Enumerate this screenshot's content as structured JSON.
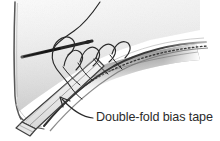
{
  "figure": {
    "kind": "technical-illustration",
    "medium": "pencil-sketch",
    "background_color": "#ffffff",
    "width": 220,
    "height": 141
  },
  "annotations": {
    "callouts": [
      {
        "id": "bias-tape",
        "label": "Double-fold bias tape",
        "text_x": 96,
        "text_y": 121,
        "leader_from_x": 94,
        "leader_to_x": 60,
        "leader_to_y": 98,
        "arrow": "up-left"
      }
    ]
  },
  "colors": {
    "ink": "#2b2b2b",
    "line": "#3a3a3a",
    "pencil_light": "#cfcfcf",
    "pencil_mid": "#9a9a9a",
    "pencil_dark": "#4a4a4a",
    "shadow": "#6d6d6d",
    "tape_fill": "#efefef",
    "fabric_fill": "#f4f4f4"
  },
  "elements": {
    "fabric_panel": "main fabric body filling upper-left with soft pencil shading",
    "fabric_left_edge": "vertical fold edge running down the left side",
    "folded_edge": "long folded fabric edge sweeping to the right",
    "stitch_line": "dotted machine stitch line along the folded edge",
    "shadow_wedge": "dark graphite wedge of shadow beneath the folded edge",
    "bias_tape": "light double-fold bias tape strip running diagonally to lower left",
    "tape_end": "angled cut end of the bias tape at lower left",
    "needle": "sewing needle crossing the fabric at upper left",
    "thread": "thread curving up off the top of the frame",
    "stitch_loops": "row of looped whipstitches over the tape edge"
  }
}
